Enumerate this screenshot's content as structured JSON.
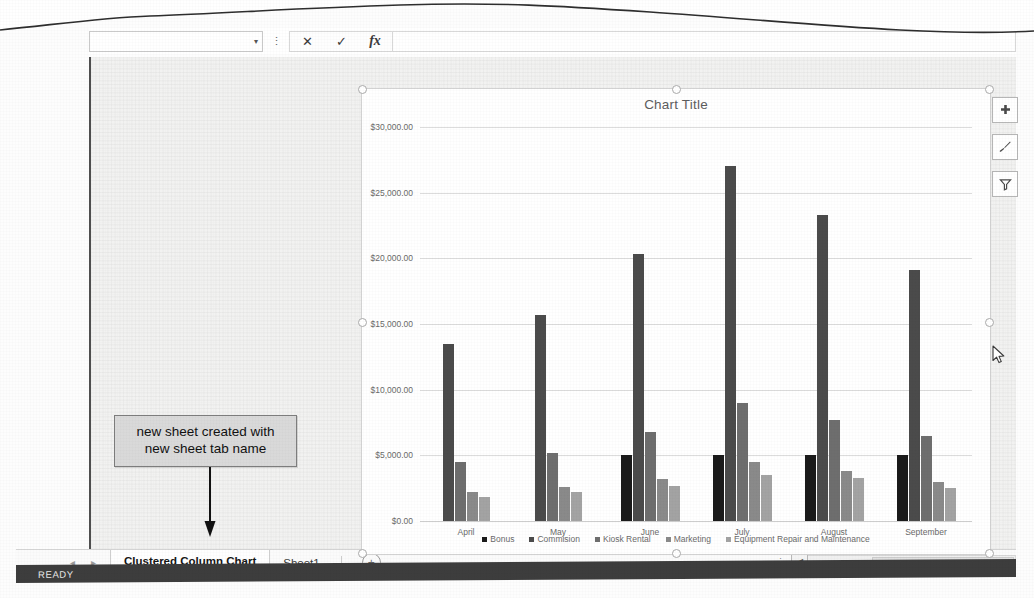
{
  "application": {
    "status_bar": {
      "text": "READY"
    }
  },
  "formula_bar": {
    "name_box_value": "",
    "name_box_caret": "▾",
    "cancel_icon": "✕",
    "enter_icon": "✓",
    "function_icon": "fx",
    "formula_value": "",
    "formula_placeholder": ""
  },
  "sheet_tabs": {
    "nav_prev": "◂",
    "nav_next": "▸",
    "tabs": [
      {
        "label": "Clustered Column Chart",
        "active": true
      },
      {
        "label": "Sheet1",
        "active": false
      }
    ],
    "new_sheet_label": "+"
  },
  "scrollbar": {
    "left_arrow": "◀",
    "split_handle": "⋮"
  },
  "chart": {
    "side_buttons": [
      {
        "name": "chart-elements",
        "icon": "plus-icon"
      },
      {
        "name": "chart-styles",
        "icon": "brush-icon"
      },
      {
        "name": "chart-filters",
        "icon": "funnel-icon"
      }
    ]
  },
  "annotation": {
    "callout_line1": "new sheet created with",
    "callout_line2": "new sheet tab name"
  },
  "colors": {
    "series_bonus": "#1a1a1a",
    "series_commision": "#4b4b4b",
    "series_kiosk": "#6e6e6e",
    "series_marketing": "#8a8a8a",
    "series_equipment": "#a3a3a3",
    "gridline": "#dcdcdc",
    "chart_text": "#6a6a6a",
    "status_bar": "#3d3d3d"
  },
  "chart_data": {
    "type": "bar",
    "title": "Chart Title",
    "xlabel": "",
    "ylabel": "",
    "ylim": [
      0,
      30000
    ],
    "ytick_labels": [
      "$0.00",
      "$5,000.00",
      "$10,000.00",
      "$15,000.00",
      "$20,000.00",
      "$25,000.00",
      "$30,000.00"
    ],
    "ytick_values": [
      0,
      5000,
      10000,
      15000,
      20000,
      25000,
      30000
    ],
    "grid": true,
    "legend_position": "bottom",
    "categories": [
      "April",
      "May",
      "June",
      "July",
      "August",
      "September"
    ],
    "series": [
      {
        "name": "Bonus",
        "color": "#1a1a1a",
        "values": [
          0,
          0,
          5000,
          5000,
          5000,
          5000
        ]
      },
      {
        "name": "Commision",
        "color": "#4b4b4b",
        "values": [
          13500,
          15700,
          20300,
          27000,
          23300,
          19100
        ]
      },
      {
        "name": "Kiosk Rental",
        "color": "#6e6e6e",
        "values": [
          4500,
          5200,
          6800,
          9000,
          7700,
          6500
        ]
      },
      {
        "name": "Marketing",
        "color": "#8a8a8a",
        "values": [
          2200,
          2600,
          3200,
          4500,
          3800,
          3000
        ]
      },
      {
        "name": "Equipment Repair and Maintenance",
        "color": "#a3a3a3",
        "values": [
          1800,
          2200,
          2700,
          3500,
          3300,
          2500
        ]
      }
    ]
  }
}
